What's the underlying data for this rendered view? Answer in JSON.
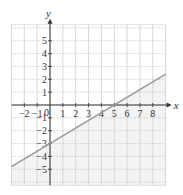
{
  "chart_data": {
    "type": "line",
    "title": "",
    "xlabel": "x",
    "ylabel": "y",
    "xlim": [
      -3,
      9
    ],
    "ylim": [
      -6.25,
      6.25
    ],
    "grid": true,
    "x_ticks": [
      -2,
      -1,
      0,
      1,
      2,
      3,
      4,
      5,
      6,
      7,
      8
    ],
    "y_ticks": [
      -5,
      -4,
      -3,
      -2,
      -1,
      1,
      2,
      3,
      4,
      5
    ],
    "origin_label": "0",
    "series": [
      {
        "name": "line",
        "equation": "y = (3/5)x - 3",
        "x": [
          -3,
          0,
          5,
          9
        ],
        "y": [
          -4.8,
          -3,
          0,
          2.4
        ],
        "color": "#9a9a9a"
      }
    ],
    "shaded_region": "below line",
    "shade_color": "#f3f3f3"
  }
}
